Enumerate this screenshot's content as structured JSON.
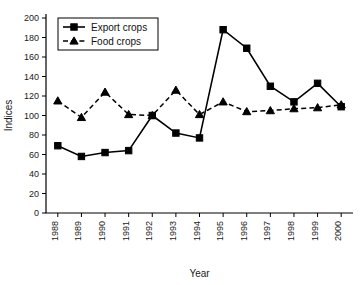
{
  "chart_data": {
    "type": "line",
    "title": "",
    "xlabel": "Year",
    "ylabel": "Indices",
    "categories": [
      "1988",
      "1989",
      "1990",
      "1991",
      "1992",
      "1993",
      "1994",
      "1995",
      "1996",
      "1997",
      "1998",
      "1999",
      "2000"
    ],
    "x": [
      1988,
      1989,
      1990,
      1991,
      1992,
      1993,
      1994,
      1995,
      1996,
      1997,
      1998,
      1999,
      2000
    ],
    "series": [
      {
        "name": "Export crops",
        "marker": "square",
        "linestyle": "solid",
        "color": "#000000",
        "values": [
          69,
          58,
          62,
          64,
          100,
          82,
          77,
          188,
          169,
          130,
          114,
          133,
          109
        ]
      },
      {
        "name": "Food crops",
        "marker": "triangle",
        "linestyle": "dashed",
        "color": "#000000",
        "values": [
          115,
          98,
          124,
          101,
          100,
          126,
          101,
          114,
          104,
          105,
          107,
          108,
          111
        ]
      }
    ],
    "ylim": [
      0,
      200
    ],
    "ytick_step": 20,
    "yticks": [
      0,
      20,
      40,
      60,
      80,
      100,
      120,
      140,
      160,
      180,
      200
    ],
    "grid": false,
    "legend_position": "top-left",
    "xtick_rotation": 90
  },
  "legend": {
    "items": [
      {
        "label": "Export crops"
      },
      {
        "label": "Food crops"
      }
    ]
  },
  "watermark": {
    "text": ""
  }
}
